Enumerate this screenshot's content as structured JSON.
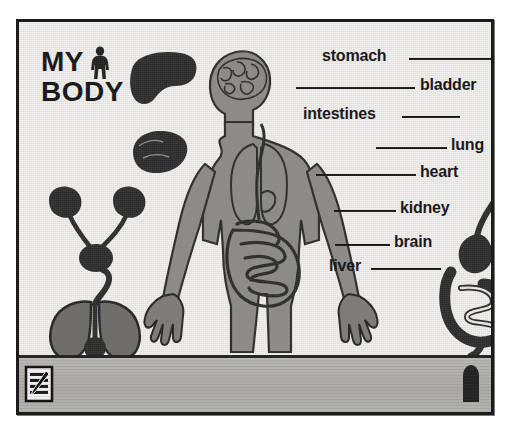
{
  "app": {
    "title_line1": "MY",
    "title_line2": "BODY",
    "figure_icon": "human-figure-icon"
  },
  "canvas": {
    "background_color": "#f4f2ef",
    "organ_fill": "#2a2a2a",
    "body_fill": "#8e8c88",
    "outline_color": "#1b1b1b"
  },
  "labels": [
    {
      "id": "stomach",
      "text": "stomach",
      "x": 303,
      "y": 32,
      "line_x": 390,
      "line_y": 42,
      "line_w": 92
    },
    {
      "id": "bladder",
      "text": "bladder",
      "x": 401,
      "y": 61,
      "line_x": 277,
      "line_y": 71,
      "line_w": 119
    },
    {
      "id": "intestines",
      "text": "intestines",
      "x": 284,
      "y": 90,
      "line_x": 383,
      "line_y": 100,
      "line_w": 58
    },
    {
      "id": "lung",
      "text": "lung",
      "x": 432,
      "y": 121,
      "line_x": 357,
      "line_y": 131,
      "line_w": 71
    },
    {
      "id": "heart",
      "text": "heart",
      "x": 401,
      "y": 148,
      "line_x": 297,
      "line_y": 158,
      "line_w": 100
    },
    {
      "id": "kidney",
      "text": "kidney",
      "x": 381,
      "y": 184,
      "line_x": 315,
      "line_y": 194,
      "line_w": 62
    },
    {
      "id": "brain",
      "text": "brain",
      "x": 375,
      "y": 218,
      "line_x": 316,
      "line_y": 228,
      "line_w": 55
    },
    {
      "id": "liver",
      "text": "liver",
      "x": 310,
      "y": 242,
      "line_x": 352,
      "line_y": 252,
      "line_w": 70
    }
  ],
  "organs": [
    {
      "id": "liver-organ",
      "name": "liver-shape",
      "x": 110,
      "y": 30,
      "w": 68,
      "h": 56
    },
    {
      "id": "brain-organ",
      "name": "brain-shape",
      "x": 113,
      "y": 110,
      "w": 56,
      "h": 42
    },
    {
      "id": "urinary-organ",
      "name": "kidneys-bladder",
      "x": 22,
      "y": 165,
      "w": 110,
      "h": 95
    },
    {
      "id": "lungs-organ",
      "name": "lungs-trachea",
      "x": 26,
      "y": 250,
      "w": 100,
      "h": 92
    },
    {
      "id": "digestive-organ",
      "name": "stomach-intestines",
      "x": 420,
      "y": 145,
      "w": 80,
      "h": 190
    }
  ],
  "body": {
    "name": "human-body-diagram",
    "parts": [
      "head",
      "brain",
      "lungs",
      "esophagus",
      "heart",
      "intestines",
      "arms",
      "hands",
      "legs"
    ]
  },
  "toolbar": {
    "left_icon": "document-pencil-icon",
    "right_icon": "stomach-thumbnail-icon"
  }
}
